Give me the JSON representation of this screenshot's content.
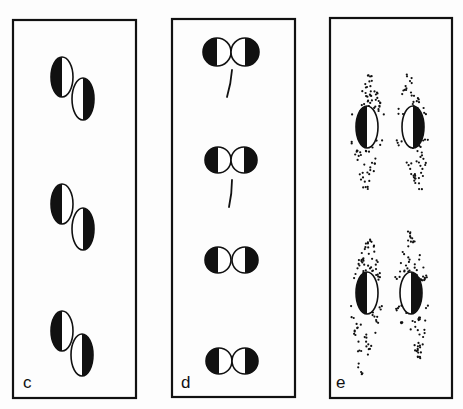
{
  "figure": {
    "width": 463,
    "height": 409,
    "ink_color": "#111111",
    "paper_color": "#fdfdfd"
  },
  "panels": [
    {
      "id": "c",
      "label": "c",
      "box": {
        "x": 13,
        "y": 20,
        "w": 123,
        "h": 378
      },
      "label_pos": {
        "x": 23,
        "y": 374
      },
      "glyph_type": "ellipse-pair-diagonal",
      "pairs": [
        {
          "left": {
            "cx": 62,
            "cy": 77,
            "rx": 11,
            "ry": 20,
            "dark_side": "left"
          },
          "right": {
            "cx": 83,
            "cy": 99,
            "rx": 11,
            "ry": 21,
            "dark_side": "right"
          }
        },
        {
          "left": {
            "cx": 62,
            "cy": 204,
            "rx": 11,
            "ry": 20,
            "dark_side": "left"
          },
          "right": {
            "cx": 83,
            "cy": 229,
            "rx": 11,
            "ry": 21,
            "dark_side": "right"
          }
        },
        {
          "left": {
            "cx": 62,
            "cy": 331,
            "rx": 11,
            "ry": 20,
            "dark_side": "left"
          },
          "right": {
            "cx": 82,
            "cy": 355,
            "rx": 11,
            "ry": 21,
            "dark_side": "right"
          }
        }
      ]
    },
    {
      "id": "d",
      "label": "d",
      "box": {
        "x": 172,
        "y": 19,
        "w": 123,
        "h": 378
      },
      "label_pos": {
        "x": 181,
        "y": 374
      },
      "glyph_type": "circle-pair-horizontal",
      "pairs": [
        {
          "left": {
            "cx": 217,
            "cy": 52,
            "r": 14,
            "dark_side": "left"
          },
          "right": {
            "cx": 245,
            "cy": 52,
            "r": 14,
            "dark_side": "right"
          },
          "tick": {
            "x1": 232,
            "y1": 70,
            "x2": 227,
            "y2": 97
          }
        },
        {
          "left": {
            "cx": 218,
            "cy": 160,
            "r": 13,
            "dark_side": "left"
          },
          "right": {
            "cx": 244,
            "cy": 160,
            "r": 13,
            "dark_side": "right"
          },
          "tick": {
            "x1": 232,
            "y1": 180,
            "x2": 229,
            "y2": 207
          }
        },
        {
          "left": {
            "cx": 218,
            "cy": 260,
            "r": 13,
            "dark_side": "left"
          },
          "right": {
            "cx": 245,
            "cy": 260,
            "r": 13,
            "dark_side": "right"
          },
          "tick": null
        },
        {
          "left": {
            "cx": 219,
            "cy": 361,
            "r": 13,
            "dark_side": "left"
          },
          "right": {
            "cx": 245,
            "cy": 361,
            "r": 13,
            "dark_side": "right"
          },
          "tick": null
        }
      ]
    },
    {
      "id": "e",
      "label": "e",
      "box": {
        "x": 330,
        "y": 18,
        "w": 122,
        "h": 380
      },
      "label_pos": {
        "x": 336,
        "y": 374
      },
      "glyph_type": "ellipse-with-dot-cloud",
      "items": [
        {
          "ellipse": {
            "cx": 367,
            "cy": 127,
            "rx": 11,
            "ry": 21,
            "dark_side": "left"
          },
          "cloud": {
            "top": [
              370,
              75
            ],
            "bottom": [
              366,
              192
            ],
            "seed": 11,
            "count": 95
          }
        },
        {
          "ellipse": {
            "cx": 413,
            "cy": 127,
            "rx": 11,
            "ry": 21,
            "dark_side": "right"
          },
          "cloud": {
            "top": [
              407,
              72
            ],
            "bottom": [
              420,
              190
            ],
            "seed": 23,
            "count": 95
          }
        },
        {
          "ellipse": {
            "cx": 367,
            "cy": 293,
            "rx": 11,
            "ry": 21,
            "dark_side": "left"
          },
          "cloud": {
            "top": [
              370,
              238
            ],
            "bottom": [
              361,
              375
            ],
            "seed": 37,
            "count": 100
          }
        },
        {
          "ellipse": {
            "cx": 411,
            "cy": 293,
            "rx": 11,
            "ry": 21,
            "dark_side": "right"
          },
          "cloud": {
            "top": [
              410,
              231
            ],
            "bottom": [
              420,
              364
            ],
            "seed": 51,
            "count": 100
          }
        }
      ]
    }
  ]
}
